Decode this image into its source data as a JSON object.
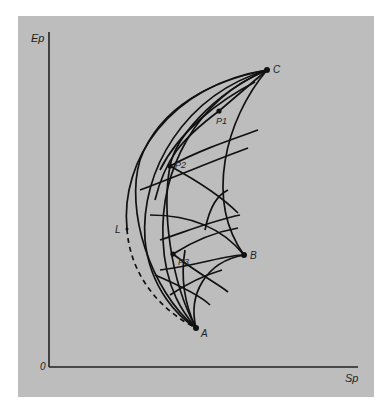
{
  "figure": {
    "background_color": "#bdbdbd",
    "line_color": "#111111",
    "axes": {
      "ylabel": "Ep",
      "xlabel": "Sp",
      "origin_label": "0"
    },
    "points": {
      "C": "C",
      "P1": "P1",
      "P2": "P2",
      "L": "L",
      "P3": "P3",
      "B": "B",
      "A": "A"
    }
  }
}
